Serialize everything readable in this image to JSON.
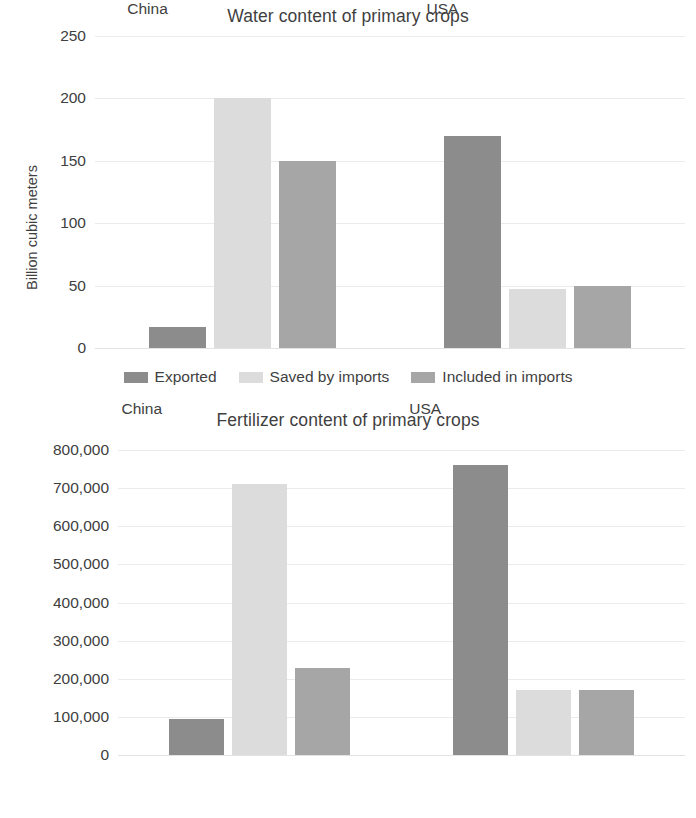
{
  "figures": [
    {
      "id": "water",
      "title": "Water content of primary crops",
      "ylabel": "Billion cubic  meters",
      "xticks": [
        "China",
        "USA"
      ],
      "legend": [
        "Exported",
        "Saved by imports",
        "Included in imports"
      ]
    },
    {
      "id": "fertilizer",
      "title": "Fertilizer content of primary crops",
      "ylabel": "Nitrogenous fertilizer (tons)",
      "xticks": [
        "China",
        "USA"
      ],
      "legend": [
        "Exported",
        "Saved by imports",
        "Included in imports"
      ]
    }
  ],
  "colors": {
    "exported": "#8c8c8c",
    "saved_by_imports": "#dcdcdc",
    "included_in_imports": "#a6a6a6",
    "gridline": "#ececec",
    "text": "#404040"
  },
  "chart_data": [
    {
      "type": "bar",
      "title": "Water content of primary crops",
      "xlabel": "",
      "ylabel": "Billion cubic  meters",
      "categories": [
        "China",
        "USA"
      ],
      "ylim": [
        0,
        250
      ],
      "yticks": [
        "0",
        "50",
        "100",
        "150",
        "200",
        "250"
      ],
      "ytick_values": [
        0,
        50,
        100,
        150,
        200,
        250
      ],
      "grid": true,
      "legend_position": "bottom",
      "series": [
        {
          "name": "Exported",
          "color": "#8c8c8c",
          "values": [
            17,
            170
          ]
        },
        {
          "name": "Saved by imports",
          "color": "#dcdcdc",
          "values": [
            200,
            47
          ]
        },
        {
          "name": "Included in imports",
          "color": "#a6a6a6",
          "values": [
            150,
            50
          ]
        }
      ]
    },
    {
      "type": "bar",
      "title": "Fertilizer content of primary crops",
      "xlabel": "",
      "ylabel": "Nitrogenous fertilizer (tons)",
      "categories": [
        "China",
        "USA"
      ],
      "ylim": [
        0,
        800000
      ],
      "yticks": [
        "0",
        "100,000",
        "200,000",
        "300,000",
        "400,000",
        "500,000",
        "600,000",
        "700,000",
        "800,000"
      ],
      "ytick_values": [
        0,
        100000,
        200000,
        300000,
        400000,
        500000,
        600000,
        700000,
        800000
      ],
      "grid": true,
      "legend_position": "bottom",
      "series": [
        {
          "name": "Exported",
          "color": "#8c8c8c",
          "values": [
            95000,
            760000
          ]
        },
        {
          "name": "Saved by imports",
          "color": "#dcdcdc",
          "values": [
            712000,
            170000
          ]
        },
        {
          "name": "Included in imports",
          "color": "#a6a6a6",
          "values": [
            228000,
            170000
          ]
        }
      ]
    }
  ]
}
